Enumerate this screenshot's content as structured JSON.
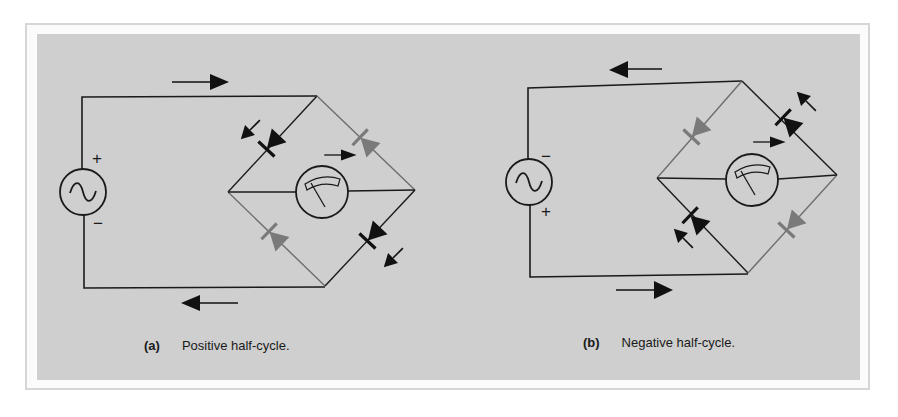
{
  "colors": {
    "background": "#ffffff",
    "frame": "#d6d6d6",
    "panel": "#cfcfcf",
    "wire": "#1a1a1a",
    "inactive_wire": "#6e6e6e",
    "active_diode": "#111111",
    "inactive_diode": "#7a7a7a"
  },
  "panels": [
    {
      "id": "a",
      "caption_tag": "(a)",
      "caption_text": "Positive half-cycle.",
      "source": {
        "icon": "ac-source-icon",
        "top_polarity": "+",
        "bottom_polarity": "−"
      },
      "meter": {
        "icon": "meter-icon",
        "current_direction": "left-to-right"
      },
      "top_current_arrow": "right",
      "bottom_current_arrow": "left",
      "conducting_diodes": [
        "top-left",
        "bottom-right"
      ],
      "blocking_diodes": [
        "top-right",
        "bottom-left"
      ]
    },
    {
      "id": "b",
      "caption_tag": "(b)",
      "caption_text": "Negative half-cycle.",
      "source": {
        "icon": "ac-source-icon",
        "top_polarity": "−",
        "bottom_polarity": "+"
      },
      "meter": {
        "icon": "meter-icon",
        "current_direction": "left-to-right"
      },
      "top_current_arrow": "left",
      "bottom_current_arrow": "right",
      "conducting_diodes": [
        "top-right",
        "bottom-left"
      ],
      "blocking_diodes": [
        "top-left",
        "bottom-right"
      ]
    }
  ]
}
